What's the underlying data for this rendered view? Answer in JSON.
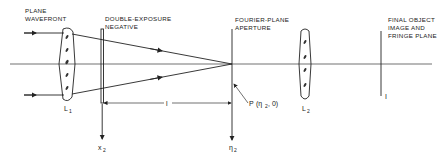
{
  "diagram": {
    "type": "optical-setup",
    "labels": {
      "plane_wavefront": [
        "PLANE",
        "WAVEFRONT"
      ],
      "double_exposure": [
        "DOUBLE-EXPOSURE",
        "NEGATIVE"
      ],
      "fourier_plane": [
        "FOURIER-PLANE",
        "APERTURE"
      ],
      "final_plane": [
        "FINAL OBJECT",
        "IMAGE AND",
        "FRINGE PLANE"
      ]
    },
    "symbols": {
      "lens1": "L",
      "lens1_sub": "1",
      "lens2": "L",
      "lens2_sub": "2",
      "x2": "x",
      "x2_sub": "2",
      "eta2": "η",
      "eta2_sub": "2",
      "distance": "l",
      "point_p": "P",
      "point_p_coords_open": "(η",
      "point_p_coords_sub": "2",
      "point_p_coords_close": ", 0)",
      "image_plane": "I"
    },
    "colors": {
      "ink": "#222222",
      "background": "#ffffff"
    }
  }
}
